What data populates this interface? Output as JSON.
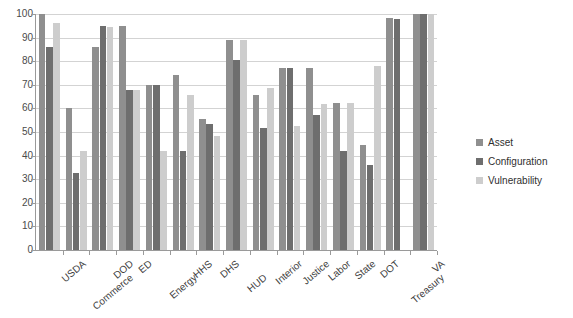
{
  "chart_data": {
    "type": "bar",
    "title": "",
    "xlabel": "",
    "ylabel": "",
    "ylim": [
      0,
      100
    ],
    "yticks": [
      0,
      10,
      20,
      30,
      40,
      50,
      60,
      70,
      80,
      90,
      100
    ],
    "grid": true,
    "legend_position": "right",
    "categories": [
      "USDA",
      "Commerce",
      "DOD",
      "ED",
      "Energy",
      "HHS",
      "DHS",
      "HUD",
      "Interior",
      "Justice",
      "Labor",
      "State",
      "DOT",
      "Treasury",
      "VA"
    ],
    "series": [
      {
        "name": "Asset",
        "color": "#8f8f8f",
        "values": [
          100,
          60,
          86,
          95,
          70,
          74,
          55.5,
          89,
          65.5,
          77,
          77,
          62.5,
          44.5,
          98.5,
          100
        ]
      },
      {
        "name": "Configuration",
        "color": "#6e6e6e",
        "values": [
          86,
          32.5,
          95,
          68,
          70,
          42,
          53.5,
          80.5,
          51.5,
          77,
          57,
          42,
          36,
          98,
          100
        ]
      },
      {
        "name": "Vulnerability",
        "color": "#cdcdcd",
        "values": [
          96,
          42,
          94.5,
          68,
          42,
          65.5,
          48.5,
          89,
          68.5,
          52.5,
          62,
          62.5,
          78,
          0,
          100
        ]
      }
    ]
  },
  "legend": {
    "items": [
      {
        "label": "Asset",
        "key": "asset"
      },
      {
        "label": "Configuration",
        "key": "configuration"
      },
      {
        "label": "Vulnerability",
        "key": "vulnerability"
      }
    ]
  }
}
